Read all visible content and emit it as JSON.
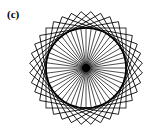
{
  "figure": {
    "label": "(c)",
    "center": [
      86,
      68
    ],
    "circle_radius": 40,
    "spoke_count": 48,
    "square_count": 9,
    "square_half_side": 40,
    "stroke_color": "#000000",
    "hub_radius": 4
  }
}
